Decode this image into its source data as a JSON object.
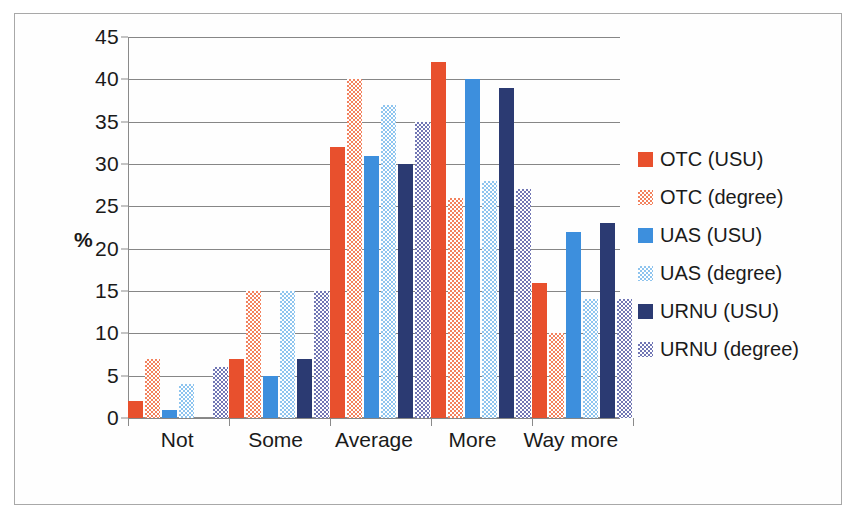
{
  "chart_data": {
    "type": "bar",
    "title": "",
    "xlabel": "",
    "ylabel": "%",
    "ylim": [
      0,
      45
    ],
    "ytick_step": 5,
    "yticks": [
      45,
      40,
      35,
      30,
      25,
      20,
      15,
      10,
      5,
      0
    ],
    "grid": true,
    "legend_position": "right",
    "categories": [
      "Not",
      "Some",
      "Average",
      "More",
      "Way more"
    ],
    "series": [
      {
        "name": "OTC (USU)",
        "color": "#E8502D",
        "pattern": "solid",
        "values": [
          2,
          7,
          32,
          42,
          16
        ]
      },
      {
        "name": "OTC (degree)",
        "color": "#F2825E",
        "pattern": "checkered",
        "values": [
          7,
          15,
          40,
          26,
          10
        ]
      },
      {
        "name": "UAS (USU)",
        "color": "#3D8FDD",
        "pattern": "solid",
        "values": [
          1,
          5,
          31,
          40,
          22
        ]
      },
      {
        "name": "UAS (degree)",
        "color": "#8EC4EE",
        "pattern": "checkered",
        "values": [
          4,
          15,
          37,
          28,
          14
        ]
      },
      {
        "name": "URNU (USU)",
        "color": "#2B3A72",
        "pattern": "solid",
        "values": [
          0,
          7,
          30,
          39,
          23
        ]
      },
      {
        "name": "URNU (degree)",
        "color": "#7176B4",
        "pattern": "checkered",
        "values": [
          6,
          15,
          35,
          27,
          14
        ]
      }
    ]
  },
  "axis": {
    "y_title": "%"
  }
}
